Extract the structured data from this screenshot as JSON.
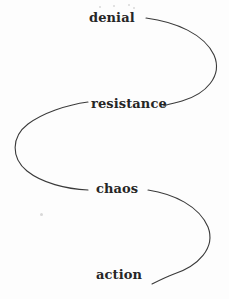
{
  "diagram": {
    "type": "s-curve-flow",
    "background_color": "#fdfdfd",
    "stroke_color": "#3a3a3a",
    "text_color": "#262626",
    "canvas": {
      "width": 229,
      "height": 299
    },
    "stages": [
      {
        "id": "denial",
        "label": "denial",
        "order": 1,
        "x": 89,
        "y": 11
      },
      {
        "id": "resistance",
        "label": "resistance",
        "order": 2,
        "x": 91,
        "y": 97
      },
      {
        "id": "chaos",
        "label": "chaos",
        "order": 3,
        "x": 96,
        "y": 182
      },
      {
        "id": "action",
        "label": "action",
        "order": 4,
        "x": 96,
        "y": 268
      }
    ],
    "connectors": [
      {
        "id": "denial-to-resistance",
        "from": "denial",
        "to": "resistance",
        "path": "M 146 18 C 176 22 204 34 214 55 C 223 76 206 94 182 101 C 175 103 169 104 163 106"
      },
      {
        "id": "resistance-to-chaos",
        "from": "resistance",
        "to": "chaos",
        "path": "M 88 102 C 66 105 43 113 28 124 C 11 137 11 158 27 171 C 42 183 66 189 88 190"
      },
      {
        "id": "chaos-to-action",
        "from": "chaos",
        "to": "action",
        "path": "M 148 190 C 174 194 199 206 208 227 C 216 248 198 266 174 274 C 166 277 158 281 152 284"
      }
    ],
    "specks": [
      {
        "x": 99,
        "y": 6,
        "size": 2
      },
      {
        "x": 113,
        "y": 5,
        "size": 2
      },
      {
        "x": 128,
        "y": 4,
        "size": 2
      },
      {
        "x": 133,
        "y": 7,
        "size": 2
      },
      {
        "x": 40,
        "y": 213,
        "size": 3
      }
    ]
  }
}
